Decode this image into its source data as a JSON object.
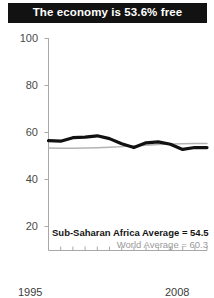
{
  "title": {
    "text": "The economy is 53.6% free"
  },
  "legend": {
    "primary": "Sub-Saharan Africa Average = 54.5",
    "secondary": "World Average = 60.3"
  },
  "axis": {
    "y_ticks": [
      "100",
      "80",
      "60",
      "40",
      "20"
    ],
    "x_start": "1995",
    "x_end": "2008"
  },
  "colors": {
    "banner_background": "#121212",
    "banner_text": "#ffffff",
    "primary_series": "#111111",
    "secondary_series": "#b3b3b3",
    "axis": "#9a9a9a",
    "tick_label": "#4a4a4a",
    "legend_secondary": "#9a9a9a"
  },
  "chart_data": {
    "type": "line",
    "title": "The economy is 53.6% free",
    "xlabel": "",
    "ylabel": "",
    "xlim": [
      1995,
      2008
    ],
    "ylim": [
      10,
      100
    ],
    "grid": false,
    "legend_position": "inside-bottom-right",
    "x": [
      1995,
      1996,
      1997,
      1998,
      1999,
      2000,
      2001,
      2002,
      2003,
      2004,
      2005,
      2006,
      2007,
      2008
    ],
    "series": [
      {
        "name": "Sub-Saharan Africa Average",
        "label": "Sub-Saharan Africa Average = 54.5",
        "color": "#111111",
        "final_value": 54.5,
        "values": [
          56.5,
          56.3,
          57.8,
          58.0,
          58.6,
          57.4,
          55.2,
          53.6,
          55.6,
          56.0,
          55.0,
          52.8,
          53.6,
          53.6
        ]
      },
      {
        "name": "World Average",
        "label": "World Average = 60.3",
        "color": "#b3b3b3",
        "final_value": 60.3,
        "values": [
          53.4,
          53.3,
          53.3,
          53.4,
          53.5,
          53.7,
          54.0,
          54.3,
          54.6,
          54.9,
          55.1,
          55.2,
          55.3,
          55.3
        ]
      }
    ],
    "y_ticks": [
      20,
      40,
      60,
      80,
      100
    ],
    "x_ticks": [
      1995,
      1996,
      1997,
      1998,
      1999,
      2000,
      2001,
      2002,
      2003,
      2004,
      2005,
      2006,
      2007,
      2008
    ],
    "x_tick_labels_shown": [
      "1995",
      "2008"
    ]
  }
}
